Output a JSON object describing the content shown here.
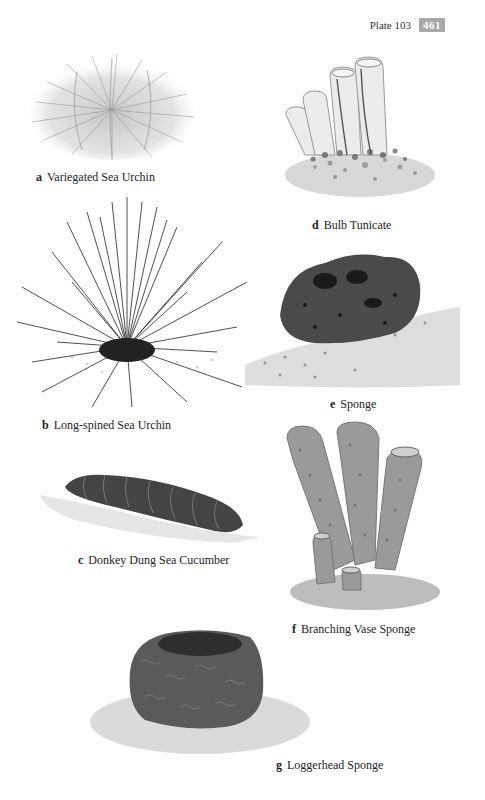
{
  "header": {
    "plate_label": "Plate 103",
    "page_number": "461"
  },
  "colors": {
    "page_badge_bg": "#a9a9a9",
    "text": "#222222",
    "background": "#ffffff"
  },
  "species": [
    {
      "letter": "a",
      "name": "Variegated Sea Urchin",
      "illustration": "urchin-short-spines"
    },
    {
      "letter": "b",
      "name": "Long-spined Sea Urchin",
      "illustration": "urchin-long-spines"
    },
    {
      "letter": "c",
      "name": "Donkey Dung Sea Cucumber",
      "illustration": "sea-cucumber"
    },
    {
      "letter": "d",
      "name": "Bulb Tunicate",
      "illustration": "tunicate-tubes"
    },
    {
      "letter": "e",
      "name": "Sponge",
      "illustration": "rounded-sponge"
    },
    {
      "letter": "f",
      "name": "Branching Vase Sponge",
      "illustration": "vase-sponge-tubes"
    },
    {
      "letter": "g",
      "name": "Loggerhead Sponge",
      "illustration": "barrel-sponge"
    }
  ]
}
